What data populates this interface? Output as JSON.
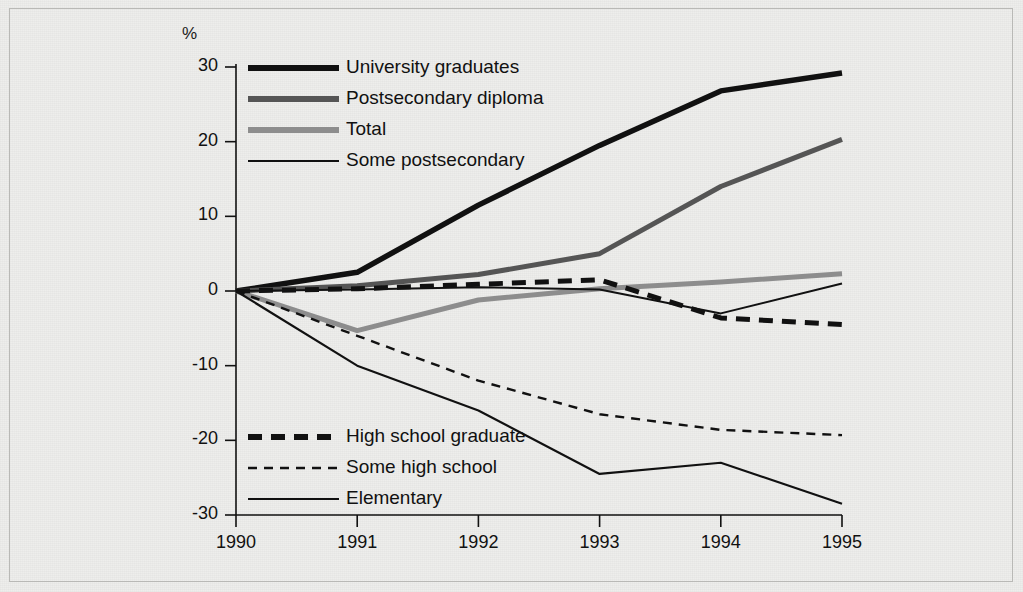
{
  "chart_data": {
    "type": "line",
    "title": "",
    "subtitle": "",
    "xlabel": "",
    "ylabel": "%",
    "axis_unit_label": "%",
    "x": [
      1990,
      1991,
      1992,
      1993,
      1994,
      1995
    ],
    "categories": [
      "1990",
      "1991",
      "1992",
      "1993",
      "1994",
      "1995"
    ],
    "xlim": [
      1990,
      1995
    ],
    "ylim": [
      -30,
      30
    ],
    "yticks": [
      30,
      20,
      10,
      0,
      -10,
      -20,
      -30
    ],
    "ytick_labels": [
      "30",
      "20",
      "10",
      "0",
      "-10",
      "-20",
      "-30"
    ],
    "xticks": [
      1990,
      1991,
      1992,
      1993,
      1994,
      1995
    ],
    "xtick_labels": [
      "1990",
      "1991",
      "1992",
      "1993",
      "1994",
      "1995"
    ],
    "grid": false,
    "legend_position": "inside-upper-left-and-lower-left",
    "series": [
      {
        "name": "University graduates",
        "values": [
          0,
          2.5,
          11.5,
          19.5,
          26.8,
          29.2
        ],
        "color": "#111111",
        "width": 5.5,
        "dash": "none",
        "legend_group": "top"
      },
      {
        "name": "Postsecondary diploma",
        "values": [
          0,
          0.7,
          2.2,
          5.0,
          14.0,
          20.3
        ],
        "color": "#555555",
        "width": 5.0,
        "dash": "none",
        "legend_group": "top"
      },
      {
        "name": "Total",
        "values": [
          0,
          -5.3,
          -1.2,
          0.3,
          1.2,
          2.3
        ],
        "color": "#8d8d8d",
        "width": 5.0,
        "dash": "none",
        "legend_group": "top"
      },
      {
        "name": "Some postsecondary",
        "values": [
          0,
          0.2,
          0.5,
          0.2,
          -3.0,
          1.0
        ],
        "color": "#111111",
        "width": 2.0,
        "dash": "none",
        "legend_group": "top"
      },
      {
        "name": "High school graduate",
        "values": [
          0,
          0.3,
          0.9,
          1.5,
          -3.6,
          -4.5
        ],
        "color": "#111111",
        "width": 5.0,
        "dash": "14,9",
        "legend_group": "bottom"
      },
      {
        "name": "Some high school",
        "values": [
          0,
          -6.0,
          -12.0,
          -16.5,
          -18.6,
          -19.3
        ],
        "color": "#111111",
        "width": 2.4,
        "dash": "9,7",
        "legend_group": "bottom"
      },
      {
        "name": "Elementary",
        "values": [
          0,
          -10.0,
          -16.0,
          -24.5,
          -23.0,
          -28.5
        ],
        "color": "#111111",
        "width": 2.2,
        "dash": "none",
        "legend_group": "bottom"
      }
    ],
    "legend_top": [
      {
        "label": "University graduates",
        "color": "#111111",
        "width": 6,
        "dash": "none"
      },
      {
        "label": "Postsecondary diploma",
        "color": "#555555",
        "width": 6,
        "dash": "none"
      },
      {
        "label": "Total",
        "color": "#8d8d8d",
        "width": 6,
        "dash": "none"
      },
      {
        "label": "Some postsecondary",
        "color": "#111111",
        "width": 2,
        "dash": "none"
      }
    ],
    "legend_bottom": [
      {
        "label": "High school graduate",
        "color": "#111111",
        "width": 6,
        "dash": "14,9"
      },
      {
        "label": "Some high school",
        "color": "#111111",
        "width": 2.4,
        "dash": "9,7"
      },
      {
        "label": "Elementary",
        "color": "#111111",
        "width": 2.2,
        "dash": "none"
      }
    ],
    "colors": {
      "axis": "#111111",
      "background": "#eeeeec",
      "frame": "#b9b9b6"
    }
  }
}
